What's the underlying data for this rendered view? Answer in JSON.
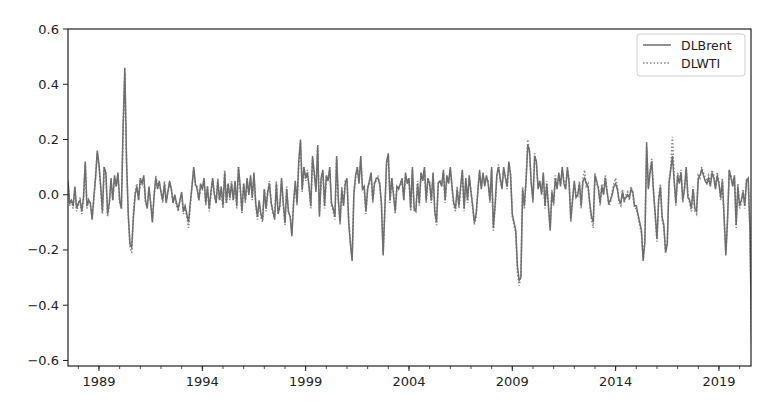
{
  "chart_data": {
    "type": "line",
    "title": "",
    "xlabel": "",
    "ylabel": "",
    "xlim": [
      1987.5,
      2020.55
    ],
    "ylim": [
      -0.62,
      0.6
    ],
    "grid": false,
    "legend_position": "top-right",
    "x_ticks": [
      1989,
      1994,
      1999,
      2004,
      2009,
      2014,
      2019
    ],
    "x_tick_labels": [
      "1989",
      "1994",
      "1999",
      "2004",
      "2009",
      "2014",
      "2019"
    ],
    "y_ticks": [
      -0.6,
      -0.4,
      -0.2,
      0.0,
      0.2,
      0.4,
      0.6
    ],
    "y_tick_labels": [
      "−0.6",
      "−0.4",
      "−0.2",
      "0.0",
      "0.2",
      "0.4",
      "0.6"
    ],
    "x_start": 1987.5,
    "x_step": 0.08333,
    "series": [
      {
        "name": "DLBrent",
        "style": "solid",
        "color": "#6e6e6e",
        "values": [
          0.05,
          -0.03,
          -0.02,
          -0.04,
          0.03,
          -0.05,
          -0.03,
          -0.02,
          -0.06,
          -0.01,
          0.12,
          -0.04,
          -0.02,
          -0.03,
          -0.09,
          -0.01,
          0.06,
          0.16,
          0.11,
          0.03,
          -0.06,
          0.1,
          0.08,
          -0.07,
          -0.03,
          0.06,
          -0.02,
          0.07,
          0.03,
          0.08,
          -0.02,
          -0.05,
          0.25,
          0.46,
          0.12,
          -0.07,
          -0.18,
          -0.19,
          -0.08,
          0.0,
          0.03,
          -0.02,
          0.06,
          0.04,
          0.07,
          -0.02,
          -0.05,
          0.03,
          -0.03,
          -0.1,
          0.0,
          0.06,
          0.02,
          0.05,
          0.01,
          -0.02,
          0.04,
          -0.03,
          0.01,
          0.05,
          0.02,
          -0.03,
          0.0,
          -0.03,
          -0.05,
          -0.02,
          0.01,
          -0.06,
          -0.04,
          -0.07,
          -0.1,
          -0.03,
          0.03,
          0.1,
          0.04,
          0.02,
          -0.02,
          0.04,
          0.02,
          0.06,
          -0.03,
          0.03,
          -0.05,
          0.01,
          0.06,
          0.0,
          -0.03,
          0.05,
          -0.02,
          0.03,
          -0.04,
          0.08,
          -0.03,
          0.04,
          -0.01,
          0.04,
          -0.02,
          0.05,
          -0.04,
          0.1,
          0.03,
          -0.06,
          0.04,
          -0.02,
          0.06,
          0.0,
          0.07,
          -0.01,
          0.08,
          -0.03,
          -0.08,
          -0.02,
          -0.07,
          -0.09,
          0.02,
          -0.05,
          0.01,
          0.04,
          -0.03,
          -0.06,
          -0.09,
          0.04,
          -0.07,
          -0.04,
          0.06,
          -0.03,
          -0.1,
          0.02,
          -0.06,
          -0.08,
          -0.15,
          -0.03,
          0.05,
          -0.03,
          0.12,
          0.2,
          0.02,
          0.1,
          0.06,
          0.08,
          0.03,
          -0.04,
          0.14,
          0.08,
          0.01,
          0.18,
          -0.08,
          0.06,
          0.09,
          -0.04,
          0.07,
          0.05,
          0.1,
          -0.03,
          -0.05,
          -0.08,
          0.14,
          -0.02,
          -0.1,
          0.02,
          -0.04,
          0.04,
          0.06,
          -0.1,
          -0.18,
          -0.24,
          0.0,
          0.07,
          0.1,
          0.04,
          0.14,
          0.02,
          0.03,
          -0.06,
          0.02,
          0.05,
          0.08,
          -0.02,
          0.04,
          0.06,
          0.06,
          0.04,
          -0.03,
          -0.22,
          -0.05,
          0.12,
          0.15,
          -0.02,
          0.06,
          0.0,
          -0.06,
          0.03,
          0.02,
          0.04,
          0.06,
          -0.02,
          0.08,
          0.04,
          0.06,
          -0.05,
          0.1,
          -0.05,
          -0.06,
          0.04,
          -0.03,
          0.08,
          0.05,
          0.1,
          -0.02,
          0.06,
          0.04,
          -0.02,
          0.08,
          -0.06,
          -0.1,
          0.04,
          0.05,
          0.03,
          0.09,
          -0.02,
          0.07,
          0.04,
          0.1,
          0.03,
          -0.03,
          -0.05,
          0.02,
          -0.04,
          0.03,
          0.09,
          -0.05,
          0.06,
          -0.02,
          0.07,
          0.01,
          -0.04,
          -0.1,
          -0.07,
          0.01,
          0.09,
          0.02,
          0.08,
          0.03,
          0.07,
          0.04,
          -0.02,
          0.1,
          -0.12,
          -0.04,
          0.07,
          0.1,
          0.06,
          0.02,
          0.1,
          0.06,
          0.03,
          0.12,
          0.07,
          -0.07,
          -0.1,
          -0.13,
          -0.26,
          -0.31,
          -0.3,
          0.02,
          -0.04,
          0.05,
          0.18,
          0.16,
          0.04,
          -0.02,
          0.14,
          0.12,
          0.02,
          0.05,
          0.0,
          0.08,
          -0.04,
          0.04,
          -0.04,
          -0.13,
          0.01,
          -0.03,
          0.06,
          0.02,
          0.08,
          0.03,
          0.1,
          0.04,
          0.02,
          0.1,
          0.04,
          -0.09,
          -0.02,
          0.05,
          -0.01,
          0.0,
          0.04,
          -0.04,
          0.05,
          0.06,
          0.04,
          0.03,
          -0.03,
          -0.08,
          -0.1,
          0.07,
          0.05,
          0.02,
          -0.03,
          0.03,
          0.0,
          0.06,
          0.01,
          -0.03,
          -0.02,
          0.0,
          0.03,
          0.04,
          0.02,
          -0.02,
          -0.03,
          0.01,
          -0.02,
          -0.01,
          0.0,
          -0.01,
          0.02,
          0.01,
          -0.04,
          -0.04,
          -0.07,
          -0.1,
          -0.13,
          -0.24,
          -0.17,
          0.19,
          0.02,
          0.08,
          0.12,
          0.01,
          -0.07,
          -0.16,
          -0.02,
          0.03,
          -0.08,
          -0.11,
          -0.21,
          -0.18,
          0.04,
          0.09,
          0.14,
          0.05,
          -0.03,
          0.07,
          0.04,
          0.08,
          -0.02,
          0.02,
          0.1,
          -0.01,
          -0.02,
          -0.05,
          0.02,
          -0.05,
          -0.06,
          0.06,
          0.07,
          0.09,
          0.07,
          0.05,
          0.04,
          0.06,
          0.03,
          0.08,
          0.06,
          0.02,
          0.07,
          0.04,
          -0.01,
          0.05,
          -0.08,
          -0.22,
          -0.09,
          0.09,
          0.06,
          0.03,
          0.07,
          -0.11,
          0.03,
          -0.04,
          -0.02,
          0.01,
          -0.04,
          0.05,
          0.06,
          -0.13,
          -0.54,
          -0.56,
          0.45
        ]
      },
      {
        "name": "DLWTI",
        "style": "dotted",
        "color": "#8a8a8a",
        "values": [
          0.04,
          -0.04,
          -0.02,
          -0.05,
          0.02,
          -0.06,
          -0.04,
          -0.01,
          -0.07,
          -0.02,
          0.11,
          -0.05,
          -0.02,
          -0.04,
          -0.08,
          -0.02,
          0.07,
          0.15,
          0.1,
          0.02,
          -0.07,
          0.1,
          0.07,
          -0.08,
          -0.03,
          0.05,
          -0.02,
          0.06,
          0.03,
          0.07,
          -0.03,
          -0.05,
          0.24,
          0.44,
          0.11,
          -0.08,
          -0.19,
          -0.21,
          -0.06,
          0.01,
          0.04,
          -0.02,
          0.05,
          0.05,
          0.06,
          -0.03,
          -0.04,
          0.02,
          -0.03,
          -0.09,
          -0.01,
          0.07,
          0.03,
          0.04,
          0.01,
          -0.03,
          0.05,
          -0.02,
          0.01,
          0.04,
          0.02,
          -0.03,
          -0.01,
          -0.04,
          -0.06,
          -0.02,
          0.0,
          -0.07,
          -0.05,
          -0.08,
          -0.12,
          -0.04,
          0.03,
          0.09,
          0.03,
          0.03,
          -0.02,
          0.03,
          0.02,
          0.05,
          -0.04,
          0.03,
          -0.06,
          0.0,
          0.05,
          0.01,
          -0.03,
          0.06,
          -0.02,
          0.02,
          -0.05,
          0.09,
          -0.03,
          0.04,
          -0.02,
          0.05,
          -0.02,
          0.04,
          -0.05,
          0.1,
          0.02,
          -0.07,
          0.04,
          -0.03,
          0.05,
          0.0,
          0.06,
          -0.02,
          0.07,
          -0.04,
          -0.09,
          -0.03,
          -0.08,
          -0.1,
          0.02,
          -0.06,
          0.01,
          0.05,
          -0.03,
          -0.07,
          -0.08,
          0.05,
          -0.06,
          -0.05,
          0.05,
          -0.04,
          -0.11,
          0.03,
          -0.07,
          -0.07,
          -0.14,
          -0.02,
          0.04,
          -0.04,
          0.11,
          0.19,
          0.01,
          0.1,
          0.05,
          0.09,
          0.02,
          -0.05,
          0.13,
          0.07,
          0.02,
          0.17,
          -0.07,
          0.05,
          0.08,
          -0.05,
          0.06,
          0.06,
          0.09,
          -0.04,
          -0.06,
          -0.09,
          0.13,
          -0.02,
          -0.11,
          0.03,
          -0.04,
          0.05,
          0.05,
          -0.09,
          -0.17,
          -0.23,
          0.01,
          0.06,
          0.1,
          0.05,
          0.13,
          0.03,
          0.02,
          -0.07,
          0.03,
          0.04,
          0.07,
          -0.03,
          0.05,
          0.05,
          0.07,
          0.04,
          -0.04,
          -0.21,
          -0.06,
          0.11,
          0.14,
          -0.03,
          0.06,
          0.01,
          -0.07,
          0.03,
          0.03,
          0.03,
          0.05,
          -0.02,
          0.07,
          0.05,
          0.05,
          -0.06,
          0.09,
          -0.06,
          -0.05,
          0.05,
          -0.04,
          0.07,
          0.06,
          0.09,
          -0.03,
          0.05,
          0.05,
          -0.03,
          0.07,
          -0.07,
          -0.11,
          0.05,
          0.04,
          0.04,
          0.08,
          -0.03,
          0.06,
          0.05,
          0.09,
          0.02,
          -0.04,
          -0.06,
          0.03,
          -0.05,
          0.02,
          0.08,
          -0.06,
          0.05,
          -0.03,
          0.06,
          0.02,
          -0.05,
          -0.11,
          -0.08,
          0.02,
          0.08,
          0.03,
          0.07,
          0.04,
          0.06,
          0.05,
          -0.03,
          0.09,
          -0.13,
          -0.05,
          0.06,
          0.11,
          0.05,
          0.03,
          0.09,
          0.07,
          0.02,
          0.11,
          0.08,
          -0.08,
          -0.11,
          -0.14,
          -0.28,
          -0.33,
          -0.29,
          0.03,
          -0.05,
          0.06,
          0.2,
          0.15,
          0.05,
          -0.03,
          0.15,
          0.11,
          0.03,
          0.04,
          0.01,
          0.07,
          -0.05,
          0.05,
          -0.05,
          -0.12,
          0.02,
          -0.04,
          0.07,
          0.03,
          0.07,
          0.04,
          0.09,
          0.05,
          0.03,
          0.09,
          0.06,
          -0.1,
          -0.01,
          0.04,
          0.0,
          -0.01,
          0.05,
          -0.05,
          0.06,
          0.09,
          0.03,
          0.04,
          -0.04,
          -0.09,
          -0.12,
          0.08,
          0.04,
          0.03,
          -0.04,
          0.04,
          0.01,
          0.07,
          0.02,
          -0.04,
          -0.03,
          0.01,
          0.04,
          0.06,
          0.03,
          -0.03,
          -0.04,
          0.02,
          -0.03,
          0.0,
          0.01,
          -0.02,
          0.03,
          0.0,
          -0.05,
          -0.05,
          -0.08,
          -0.11,
          -0.14,
          -0.23,
          -0.16,
          0.17,
          0.03,
          0.09,
          0.13,
          0.02,
          -0.08,
          -0.17,
          -0.01,
          0.04,
          -0.09,
          -0.12,
          -0.2,
          -0.17,
          0.05,
          0.1,
          0.21,
          0.06,
          -0.04,
          0.08,
          0.05,
          0.09,
          -0.03,
          0.03,
          0.09,
          0.0,
          -0.03,
          -0.06,
          0.03,
          -0.06,
          -0.07,
          0.07,
          0.06,
          0.1,
          0.08,
          0.06,
          0.05,
          0.07,
          0.04,
          0.09,
          0.07,
          0.03,
          0.08,
          0.05,
          -0.02,
          0.06,
          -0.09,
          -0.21,
          -0.08,
          0.08,
          0.07,
          0.04,
          0.06,
          -0.12,
          0.04,
          -0.05,
          -0.03,
          0.02,
          -0.05,
          0.06,
          0.05,
          -0.12,
          -0.55,
          -0.57,
          0.5
        ]
      }
    ]
  }
}
